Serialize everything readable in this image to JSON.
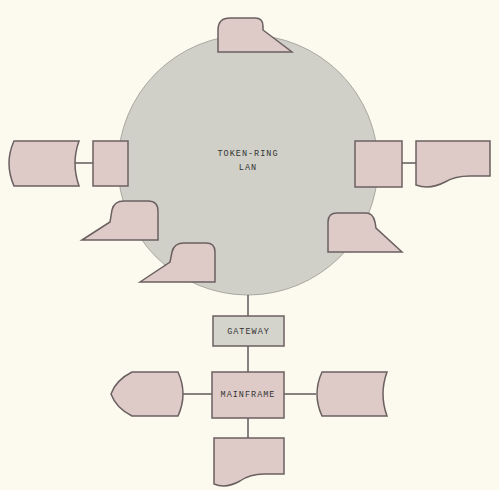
{
  "diagram": {
    "ring": {
      "label_line1": "TOKEN-RING",
      "label_line2": "LAN"
    },
    "gateway": {
      "label": "GATEWAY"
    },
    "mainframe": {
      "label": "MAINFRAME"
    },
    "colors": {
      "background": "#fcf9ee",
      "node": "#decbc8",
      "ring": "#d0d0c8",
      "gateway": "#d4d4cc",
      "stroke": "#6b6060"
    },
    "nodes": [
      {
        "id": "terminal-top",
        "type": "terminal"
      },
      {
        "id": "workstation-left",
        "type": "process-box"
      },
      {
        "id": "storage-left",
        "type": "stored-data"
      },
      {
        "id": "workstation-right",
        "type": "process-box"
      },
      {
        "id": "document-right",
        "type": "document"
      },
      {
        "id": "terminal-left-upper",
        "type": "terminal"
      },
      {
        "id": "terminal-left-lower",
        "type": "terminal"
      },
      {
        "id": "terminal-right",
        "type": "terminal"
      },
      {
        "id": "gateway",
        "type": "process-box"
      },
      {
        "id": "mainframe",
        "type": "process-box"
      },
      {
        "id": "display-left",
        "type": "display"
      },
      {
        "id": "storage-right",
        "type": "stored-data"
      },
      {
        "id": "document-bottom",
        "type": "document"
      }
    ]
  }
}
